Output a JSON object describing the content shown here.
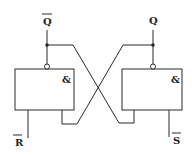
{
  "diagram": {
    "gates": [
      {
        "id": "left-gate",
        "symbol": "&",
        "output": "Q̅",
        "inputs": [
          "R̅",
          "Q (feedback)"
        ]
      },
      {
        "id": "right-gate",
        "symbol": "&",
        "output": "Q",
        "inputs": [
          "Q̅ (feedback)",
          "S̅"
        ]
      }
    ],
    "labels": {
      "q_bar": "Q",
      "q": "Q",
      "r_bar": "R",
      "s_bar": "S",
      "left_gate_symbol": "&",
      "right_gate_symbol": "&"
    },
    "overbar": {
      "q_bar": true,
      "q": false,
      "r_bar": true,
      "s_bar": true
    },
    "colors": {
      "line": "#2a2a2a",
      "background": "#ffffff"
    }
  }
}
